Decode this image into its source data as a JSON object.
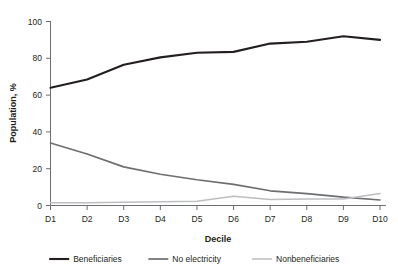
{
  "chart_data": {
    "type": "line",
    "title": "",
    "xlabel": "Decile",
    "ylabel": "Population, %",
    "categories": [
      "D1",
      "D2",
      "D3",
      "D4",
      "D5",
      "D6",
      "D7",
      "D8",
      "D9",
      "D10"
    ],
    "ylim": [
      0,
      100
    ],
    "yticks": [
      0,
      20,
      40,
      60,
      80,
      100
    ],
    "grid": false,
    "legend_position": "bottom",
    "series": [
      {
        "name": "Beneficiaries",
        "color": "#231f20",
        "values": [
          64,
          68.5,
          76.5,
          80.5,
          83,
          83.5,
          88,
          89,
          92,
          90
        ]
      },
      {
        "name": "No electricity",
        "color": "#6d6e71",
        "values": [
          34,
          28,
          21,
          17,
          14,
          11.5,
          8,
          6.5,
          4.5,
          3
        ]
      },
      {
        "name": "Nonbeneficiaries",
        "color": "#bcbec0",
        "values": [
          1.5,
          1.5,
          1.8,
          2,
          2.3,
          5,
          3.3,
          3.5,
          3.5,
          6.5
        ]
      }
    ]
  },
  "axes": {
    "y_title": "Population, %",
    "x_title": "Decile",
    "y_tick_labels": [
      "100",
      "80",
      "60",
      "40",
      "20",
      "0"
    ],
    "x_tick_labels": [
      "D1",
      "D2",
      "D3",
      "D4",
      "D5",
      "D6",
      "D7",
      "D8",
      "D9",
      "D10"
    ]
  },
  "legend": {
    "items": [
      {
        "label": "Beneficiaries",
        "color": "#231f20"
      },
      {
        "label": "No electricity",
        "color": "#6d6e71"
      },
      {
        "label": "Nonbeneficiaries",
        "color": "#bcbec0"
      }
    ]
  },
  "colors": {
    "beneficiaries": "#231f20",
    "no_electricity": "#6d6e71",
    "nonbeneficiaries": "#bcbec0",
    "axis": "#6d6e71",
    "text": "#231f20",
    "background": "#ffffff"
  }
}
